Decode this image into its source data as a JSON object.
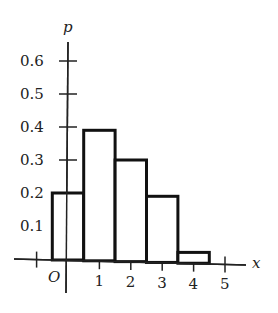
{
  "chart_data": {
    "type": "bar",
    "title": "",
    "xlabel": "x",
    "ylabel": "p",
    "origin_label": "O",
    "categories": [
      "0",
      "1",
      "2",
      "3",
      "4"
    ],
    "values": [
      0.2,
      0.39,
      0.3,
      0.19,
      0.02
    ],
    "x_ticks": [
      "1",
      "2",
      "3",
      "4",
      "5"
    ],
    "y_ticks": [
      "0.1",
      "0.2",
      "0.3",
      "0.4",
      "0.5",
      "0.6"
    ],
    "xlim": [
      -1.5,
      5.5
    ],
    "ylim": [
      0,
      0.7
    ],
    "grid": false,
    "legend": null,
    "colors": {
      "bar_stroke": "#111111",
      "bar_fill": "#ffffff",
      "axis": "#222222"
    }
  }
}
